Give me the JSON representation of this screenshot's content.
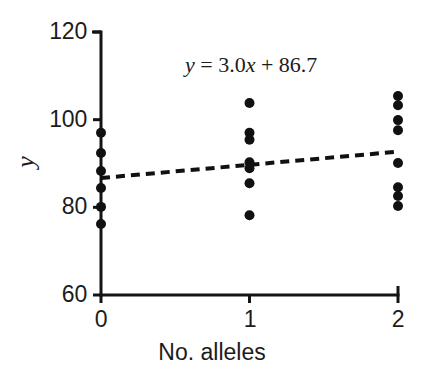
{
  "chart_data": {
    "type": "scatter",
    "title": "",
    "xlabel": "No. alleles",
    "ylabel": "y",
    "xlim": [
      0,
      2
    ],
    "ylim": [
      60,
      120
    ],
    "xticks": [
      "0",
      "1",
      "2"
    ],
    "yticks": [
      "60",
      "80",
      "100",
      "120"
    ],
    "xtick_values": [
      0,
      1,
      2
    ],
    "ytick_values": [
      60,
      80,
      100,
      120
    ],
    "grid": false,
    "legend": null,
    "annotation": "y = 3.0x + 86.7",
    "annotation_parts": {
      "y": "y",
      "eq": " = 3.0",
      "x": "x",
      "rest": " + 86.7"
    },
    "fit_line": {
      "style": "dashed",
      "slope": 3.0,
      "intercept": 86.7,
      "color": "#111111",
      "x_start": 0,
      "y_start": 86.7,
      "x_end": 2,
      "y_end": 92.7
    },
    "marker": {
      "shape": "circle",
      "color": "#111111",
      "size": 5
    },
    "series": [
      {
        "name": "observations",
        "points": [
          {
            "x": 0,
            "y": 97.0
          },
          {
            "x": 0,
            "y": 92.4
          },
          {
            "x": 0,
            "y": 88.3
          },
          {
            "x": 0,
            "y": 84.4
          },
          {
            "x": 0,
            "y": 80.1
          },
          {
            "x": 0,
            "y": 76.2
          },
          {
            "x": 1,
            "y": 103.8
          },
          {
            "x": 1,
            "y": 97.0
          },
          {
            "x": 1,
            "y": 95.4
          },
          {
            "x": 1,
            "y": 90.3
          },
          {
            "x": 1,
            "y": 88.9
          },
          {
            "x": 1,
            "y": 85.5
          },
          {
            "x": 1,
            "y": 78.2
          },
          {
            "x": 2,
            "y": 105.4
          },
          {
            "x": 2,
            "y": 103.3
          },
          {
            "x": 2,
            "y": 99.9
          },
          {
            "x": 2,
            "y": 97.6
          },
          {
            "x": 2,
            "y": 90.1
          },
          {
            "x": 2,
            "y": 84.6
          },
          {
            "x": 2,
            "y": 82.6
          },
          {
            "x": 2,
            "y": 80.3
          }
        ]
      }
    ]
  },
  "axis": {
    "color": "#141414",
    "line_width": 3
  },
  "background": "#ffffff"
}
